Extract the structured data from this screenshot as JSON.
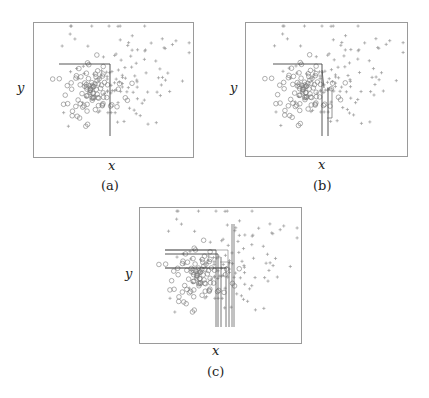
{
  "figure": {
    "panels": [
      {
        "id": "a",
        "caption": "(a)",
        "xlabel": "x",
        "ylabel": "y"
      },
      {
        "id": "b",
        "caption": "(b)",
        "xlabel": "x",
        "ylabel": "y"
      },
      {
        "id": "c",
        "caption": "(c)",
        "xlabel": "x",
        "ylabel": "y"
      }
    ]
  },
  "chart_data": [
    {
      "type": "scatter",
      "title": "(a)",
      "xlabel": "x",
      "ylabel": "y",
      "grid": false,
      "series": [
        {
          "name": "circles",
          "marker": "o",
          "description": "dense cluster of circle points, left-center of plot"
        },
        {
          "name": "crosses",
          "marker": "+",
          "description": "scattered plus points, spread upper/right"
        }
      ],
      "annotations": [
        {
          "type": "box-corner",
          "description": "single L-shaped region boundary (top edge + right edge) enclosing circle cluster"
        }
      ]
    },
    {
      "type": "scatter",
      "title": "(b)",
      "xlabel": "x",
      "ylabel": "y",
      "grid": false,
      "series": [
        {
          "name": "circles",
          "marker": "o"
        },
        {
          "name": "crosses",
          "marker": "+"
        }
      ],
      "annotations": [
        {
          "type": "box-corner",
          "description": "L-shaped boundary as in (a) plus a second nested vertical boundary and a thin rectangle to its right"
        }
      ]
    },
    {
      "type": "scatter",
      "title": "(c)",
      "xlabel": "x",
      "ylabel": "y",
      "grid": false,
      "series": [
        {
          "name": "circles",
          "marker": "o"
        },
        {
          "name": "crosses",
          "marker": "+"
        }
      ],
      "annotations": [
        {
          "type": "box-corner",
          "description": "many overlapping L-shaped boundaries: ~3 horizontal top edges and ~6 vertical right edges"
        }
      ]
    }
  ]
}
